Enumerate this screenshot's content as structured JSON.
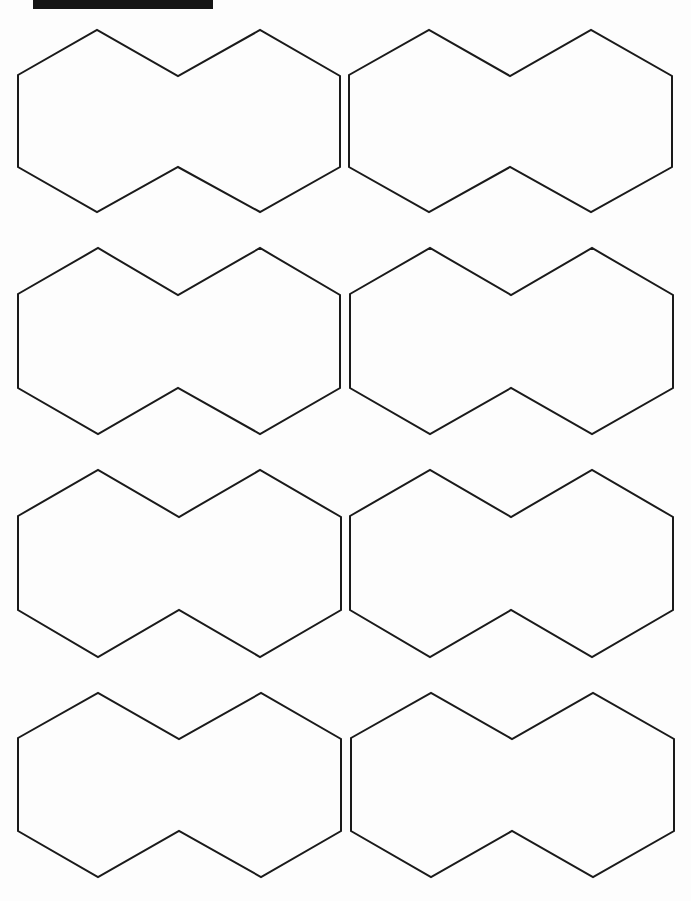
{
  "page": {
    "background": "#fdfdfd",
    "stroke_color": "#1a1a1a",
    "top_bar": {
      "x": 33,
      "y": 0,
      "width": 180,
      "height": 9,
      "color": "#151515"
    }
  },
  "shapes": [
    {
      "name": "double-hexagon-r1-c1",
      "points": "18,75 97,30 178,76 260,30 340,76 340,167 260,212 178,167 97,212 18,167"
    },
    {
      "name": "double-hexagon-r1-c2",
      "points": "349,75 429,30 510,76 591,30 672,76 672,167 591,212 510,167 429,212 349,167"
    },
    {
      "name": "double-hexagon-r2-c1",
      "points": "18,294 98,248 178,295 260,248 340,295 340,388 260,434 178,388 98,434 18,388"
    },
    {
      "name": "double-hexagon-r2-c2",
      "points": "350,294 430,248 511,295 592,248 673,295 673,388 592,434 511,388 430,434 350,388"
    },
    {
      "name": "double-hexagon-r3-c1",
      "points": "18,516 98,470 179,517 260,470 341,517 341,610 260,657 179,610 98,657 18,610"
    },
    {
      "name": "double-hexagon-r3-c2",
      "points": "350,516 430,470 511,517 592,470 673,517 673,610 592,657 511,610 430,657 350,610"
    },
    {
      "name": "double-hexagon-r4-c1",
      "points": "18,738 98,693 179,739 261,693 341,739 341,831 261,877 179,831 98,877 18,831"
    },
    {
      "name": "double-hexagon-r4-c2",
      "points": "351,738 431,693 512,739 593,693 674,739 674,831 593,877 512,831 431,877 351,831"
    }
  ]
}
